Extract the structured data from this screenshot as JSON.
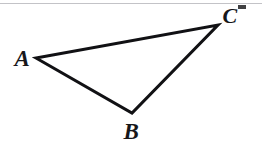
{
  "figure": {
    "kind": "geometry-diagram",
    "shape": "triangle",
    "background_color": "#ffffff",
    "stroke_color": "#111114",
    "stroke_width": 3,
    "canvas": {
      "width": 262,
      "height": 147
    },
    "vertices": [
      {
        "id": "A",
        "label": "A",
        "x": 36,
        "y": 58,
        "label_x": 22,
        "label_y": 58
      },
      {
        "id": "B",
        "label": "B",
        "x": 132,
        "y": 113,
        "label_x": 131,
        "label_y": 131
      },
      {
        "id": "C",
        "label": "C",
        "x": 218,
        "y": 25,
        "label_x": 230,
        "label_y": 16
      }
    ],
    "edges": [
      {
        "id": "AC",
        "from": "A",
        "to": "C"
      },
      {
        "id": "AB",
        "from": "A",
        "to": "B"
      },
      {
        "id": "BC",
        "from": "B",
        "to": "C"
      }
    ],
    "artifacts": {
      "scan_line_color": "#b9b9bd",
      "edge_mark_color": "#2b2b2e"
    }
  },
  "chart_data": {
    "type": "scatter",
    "title": "",
    "xlabel": "",
    "ylabel": "",
    "xlim": [
      0,
      262
    ],
    "ylim": [
      0,
      147
    ],
    "grid": false,
    "legend": "none",
    "annotations": [
      "A",
      "B",
      "C"
    ],
    "series": [
      {
        "name": "triangle ABC",
        "points": [
          {
            "label": "A",
            "x": 36,
            "y": 58
          },
          {
            "label": "B",
            "x": 132,
            "y": 113
          },
          {
            "label": "C",
            "x": 218,
            "y": 25
          }
        ],
        "closed": true
      }
    ]
  }
}
